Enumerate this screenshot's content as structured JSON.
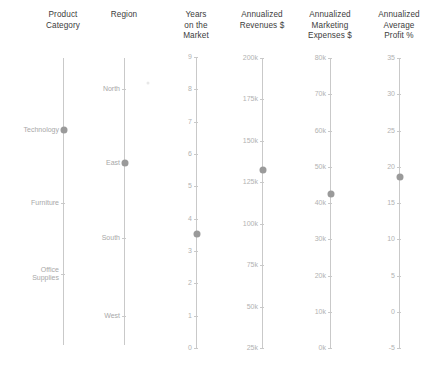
{
  "chart_data": {
    "type": "parallel-coordinates",
    "title": "",
    "grid": false,
    "legend": "none",
    "marker_color": "#9a9a9a",
    "axis_color": "#c9c9c9",
    "label_color": "#b2b2b2",
    "record": {
      "Product Category": "Technology",
      "Region": "East",
      "Years on the Market": 3.5,
      "Annualized Revenues $": 132000,
      "Annualized Marketing Expenses $": 43000,
      "Annualized Average Profit %": 18.5
    },
    "axes": [
      {
        "name": "product-category",
        "title": "Product\nCategory",
        "kind": "categorical",
        "x": 63,
        "top": 58,
        "bottom": 345,
        "categories": [
          "Technology",
          "Furniture",
          "Office Supplies"
        ],
        "tick_labels": [
          "Technology",
          "Furniture",
          "Office\nSupplies"
        ],
        "tick_y": [
          130,
          203,
          274
        ],
        "value": "Technology",
        "value_y": 130
      },
      {
        "name": "region",
        "title": "Region",
        "kind": "categorical",
        "x": 124,
        "top": 58,
        "bottom": 345,
        "categories": [
          "North",
          "East",
          "South",
          "West"
        ],
        "tick_labels": [
          "North",
          "East",
          "South",
          "West"
        ],
        "tick_y": [
          89,
          163,
          238,
          316
        ],
        "value": "East",
        "value_y": 163
      },
      {
        "name": "years-on-the-market",
        "title": "Years\non the\nMarket",
        "kind": "numeric",
        "x": 196,
        "top": 57,
        "bottom": 348,
        "ticks": [
          9,
          8,
          7,
          6,
          5,
          4,
          3,
          2,
          1,
          0
        ],
        "tick_labels": [
          "9",
          "8",
          "7",
          "6",
          "5",
          "4",
          "3",
          "2",
          "1",
          "0"
        ],
        "ylim": [
          0,
          9
        ],
        "value": 3.5,
        "value_y": 234
      },
      {
        "name": "annualized-revenues",
        "title": "Annualized\nRevenues $",
        "kind": "numeric",
        "x": 262,
        "top": 58,
        "bottom": 348,
        "ticks": [
          200000,
          175000,
          150000,
          125000,
          100000,
          75000,
          50000,
          25000
        ],
        "tick_labels": [
          "200k",
          "175k",
          "150k",
          "125k",
          "100k",
          "75k",
          "50k",
          "25k"
        ],
        "ylim": [
          25000,
          200000
        ],
        "value": 132000,
        "value_y": 170
      },
      {
        "name": "annualized-marketing-expenses",
        "title": "Annualized\nMarketing\nExpenses $",
        "kind": "numeric",
        "x": 330,
        "top": 58,
        "bottom": 348,
        "ticks": [
          80000,
          70000,
          60000,
          50000,
          40000,
          30000,
          20000,
          10000,
          0
        ],
        "tick_labels": [
          "80k",
          "70k",
          "60k",
          "50k",
          "40k",
          "30k",
          "20k",
          "10k",
          "0k"
        ],
        "ylim": [
          0,
          80000
        ],
        "value": 43000,
        "value_y": 194
      },
      {
        "name": "annualized-average-profit",
        "title": "Annualized\nAverage\nProfit %",
        "kind": "numeric",
        "x": 399,
        "top": 58,
        "bottom": 348,
        "ticks": [
          35,
          30,
          25,
          20,
          15,
          10,
          5,
          0,
          -5
        ],
        "tick_labels": [
          "35",
          "30",
          "25",
          "20",
          "15",
          "10",
          "5",
          "0",
          "-5"
        ],
        "ylim": [
          -5,
          35
        ],
        "value": 18.5,
        "value_y": 177
      }
    ],
    "cursor_dot": {
      "x": 148,
      "y": 83
    }
  }
}
